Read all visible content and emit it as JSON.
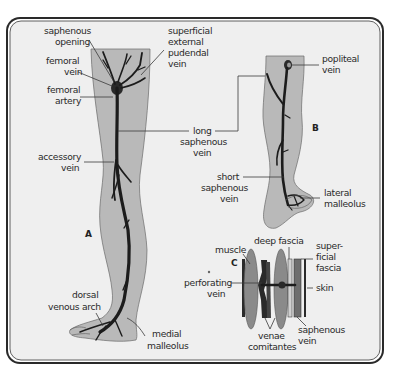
{
  "figure": {
    "panels": [
      {
        "id": "A",
        "label": "A",
        "title": "anterior-medial view of leg"
      },
      {
        "id": "B",
        "label": "B",
        "title": "posterior view of leg"
      },
      {
        "id": "C",
        "label": "C",
        "title": "cross-section of tissue layers"
      }
    ],
    "labels": {
      "saphenous_opening_1": "saphenous",
      "saphenous_opening_2": "opening",
      "femoral_vein_1": "femoral",
      "femoral_vein_2": "vein",
      "femoral_artery_1": "femoral",
      "femoral_artery_2": "artery",
      "accessory_vein_1": "accessory",
      "accessory_vein_2": "vein",
      "dorsal_venous_arch_1": "dorsal",
      "dorsal_venous_arch_2": "venous arch",
      "medial_malleolus_1": "medial",
      "medial_malleolus_2": "malleolus",
      "superficial_external_pudendal_1": "superficial",
      "superficial_external_pudendal_2": "external",
      "superficial_external_pudendal_3": "pudendal",
      "superficial_external_pudendal_4": "vein",
      "long_saphenous_1": "long",
      "long_saphenous_2": "saphenous",
      "long_saphenous_3": "vein",
      "popliteal_vein_1": "popliteal",
      "popliteal_vein_2": "vein",
      "short_saphenous_1": "short",
      "short_saphenous_2": "saphenous",
      "short_saphenous_3": "vein",
      "lateral_malleolus_1": "lateral",
      "lateral_malleolus_2": "malleolus",
      "deep_fascia": "deep fascia",
      "muscle": "muscle",
      "superficial_fascia_1": "super-",
      "superficial_fascia_2": "ficial",
      "superficial_fascia_3": "fascia",
      "perforating_vein_1": "perforating",
      "perforating_vein_2": "vein",
      "skin": "skin",
      "venae_comitantes_1": "venae",
      "venae_comitantes_2": "comitantes",
      "saphenous_vein_1": "saphenous",
      "saphenous_vein_2": "vein"
    },
    "colors": {
      "background": "#efefef",
      "frame": "#2a2a2a",
      "leg_fill": "#b9b9b9",
      "vein": "#1c1c1c",
      "text": "#2a2a2a"
    }
  }
}
